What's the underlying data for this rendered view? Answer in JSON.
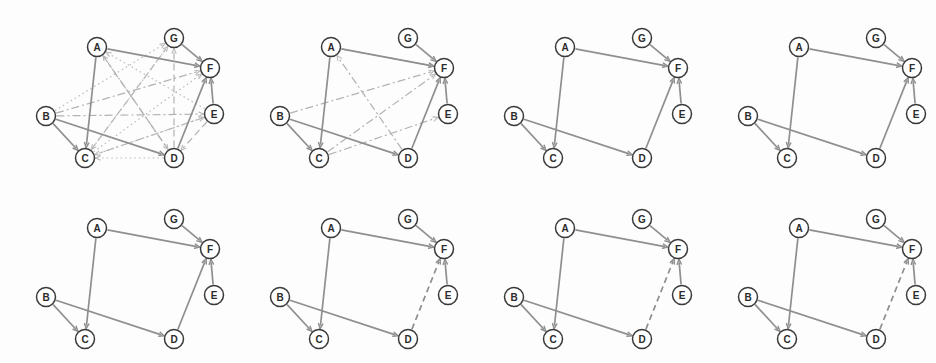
{
  "figure": {
    "title": "",
    "panel_count": 8,
    "rows": 2,
    "columns": 4,
    "background_color": "#fdfdfd",
    "node_fill": "#ffffff",
    "node_stroke": "#3a3a3a",
    "edge_color": "#9a9a9a",
    "spurious_edge_color": "#b9b9b9"
  },
  "nodes": [
    {
      "id": "A",
      "label": "A",
      "x": 97,
      "y": 47
    },
    {
      "id": "G",
      "label": "G",
      "x": 174,
      "y": 38
    },
    {
      "id": "F",
      "label": "F",
      "x": 210,
      "y": 68
    },
    {
      "id": "E",
      "label": "E",
      "x": 214,
      "y": 114
    },
    {
      "id": "B",
      "label": "B",
      "x": 46,
      "y": 116
    },
    {
      "id": "C",
      "label": "C",
      "x": 85,
      "y": 158
    },
    {
      "id": "D",
      "label": "D",
      "x": 174,
      "y": 158
    }
  ],
  "skeleton_edges": [
    {
      "from": "A",
      "to": "F",
      "style": "solid"
    },
    {
      "from": "A",
      "to": "C",
      "style": "solid"
    },
    {
      "from": "G",
      "to": "F",
      "style": "solid"
    },
    {
      "from": "E",
      "to": "F",
      "style": "solid"
    },
    {
      "from": "B",
      "to": "C",
      "style": "solid"
    },
    {
      "from": "B",
      "to": "D",
      "style": "solid"
    },
    {
      "from": "D",
      "to": "F",
      "style": "solid"
    }
  ],
  "panels": [
    {
      "index": 1,
      "name": "panel-1-complete-graph",
      "caption": "",
      "kept_edges": [
        {
          "from": "A",
          "to": "F",
          "style": "solid"
        },
        {
          "from": "A",
          "to": "C",
          "style": "solid"
        },
        {
          "from": "G",
          "to": "F",
          "style": "solid"
        },
        {
          "from": "E",
          "to": "F",
          "style": "solid"
        },
        {
          "from": "B",
          "to": "C",
          "style": "solid"
        },
        {
          "from": "B",
          "to": "D",
          "style": "solid"
        },
        {
          "from": "D",
          "to": "F",
          "style": "solid"
        }
      ],
      "spurious_edges": [
        {
          "from": "B",
          "to": "F",
          "style": "dashdot"
        },
        {
          "from": "B",
          "to": "G",
          "style": "dot"
        },
        {
          "from": "C",
          "to": "F",
          "style": "dot"
        },
        {
          "from": "C",
          "to": "G",
          "style": "dash"
        },
        {
          "from": "D",
          "to": "A",
          "style": "dash"
        },
        {
          "from": "D",
          "to": "C",
          "style": "dot"
        },
        {
          "from": "D",
          "to": "G",
          "style": "dash"
        },
        {
          "from": "E",
          "to": "C",
          "style": "dashdot"
        },
        {
          "from": "E",
          "to": "A",
          "style": "dot"
        },
        {
          "from": "E",
          "to": "D",
          "style": "dash"
        },
        {
          "from": "B",
          "to": "E",
          "style": "dashdot"
        },
        {
          "from": "C",
          "to": "E",
          "style": "dot"
        },
        {
          "from": "A",
          "to": "D",
          "style": "dashdot"
        },
        {
          "from": "G",
          "to": "C",
          "style": "dot"
        }
      ]
    },
    {
      "index": 2,
      "name": "panel-2-partially-pruned",
      "caption": "",
      "kept_edges": [
        {
          "from": "A",
          "to": "F",
          "style": "solid"
        },
        {
          "from": "A",
          "to": "C",
          "style": "solid"
        },
        {
          "from": "G",
          "to": "F",
          "style": "solid"
        },
        {
          "from": "E",
          "to": "F",
          "style": "solid"
        },
        {
          "from": "B",
          "to": "C",
          "style": "solid"
        },
        {
          "from": "B",
          "to": "D",
          "style": "solid"
        },
        {
          "from": "D",
          "to": "F",
          "style": "solid"
        }
      ],
      "spurious_edges": [
        {
          "from": "B",
          "to": "F",
          "style": "dashdot"
        },
        {
          "from": "C",
          "to": "F",
          "style": "dashdot"
        },
        {
          "from": "A",
          "to": "F",
          "style": "dashdot"
        },
        {
          "from": "C",
          "to": "E",
          "style": "dashdot"
        },
        {
          "from": "D",
          "to": "A",
          "style": "dashdot"
        }
      ]
    },
    {
      "index": 3,
      "name": "panel-3-skeleton",
      "caption": "",
      "kept_edges": [
        {
          "from": "A",
          "to": "F",
          "style": "solid"
        },
        {
          "from": "A",
          "to": "C",
          "style": "solid"
        },
        {
          "from": "G",
          "to": "F",
          "style": "solid"
        },
        {
          "from": "E",
          "to": "F",
          "style": "solid"
        },
        {
          "from": "B",
          "to": "C",
          "style": "solid"
        },
        {
          "from": "B",
          "to": "D",
          "style": "solid"
        },
        {
          "from": "D",
          "to": "F",
          "style": "solid"
        }
      ],
      "spurious_edges": []
    },
    {
      "index": 4,
      "name": "panel-4-skeleton",
      "caption": "",
      "kept_edges": [
        {
          "from": "A",
          "to": "F",
          "style": "solid"
        },
        {
          "from": "A",
          "to": "C",
          "style": "solid"
        },
        {
          "from": "G",
          "to": "F",
          "style": "solid"
        },
        {
          "from": "E",
          "to": "F",
          "style": "solid"
        },
        {
          "from": "B",
          "to": "C",
          "style": "solid"
        },
        {
          "from": "B",
          "to": "D",
          "style": "solid"
        },
        {
          "from": "D",
          "to": "F",
          "style": "solid"
        }
      ],
      "spurious_edges": []
    },
    {
      "index": 5,
      "name": "panel-5-skeleton",
      "caption": "",
      "kept_edges": [
        {
          "from": "A",
          "to": "F",
          "style": "solid"
        },
        {
          "from": "A",
          "to": "C",
          "style": "solid"
        },
        {
          "from": "G",
          "to": "F",
          "style": "solid"
        },
        {
          "from": "E",
          "to": "F",
          "style": "solid"
        },
        {
          "from": "B",
          "to": "C",
          "style": "solid"
        },
        {
          "from": "B",
          "to": "D",
          "style": "solid"
        },
        {
          "from": "D",
          "to": "F",
          "style": "solid"
        }
      ],
      "spurious_edges": []
    },
    {
      "index": 6,
      "name": "panel-6-df-dashed",
      "caption": "",
      "kept_edges": [
        {
          "from": "A",
          "to": "F",
          "style": "solid"
        },
        {
          "from": "A",
          "to": "C",
          "style": "solid"
        },
        {
          "from": "G",
          "to": "F",
          "style": "solid"
        },
        {
          "from": "E",
          "to": "F",
          "style": "solid"
        },
        {
          "from": "B",
          "to": "C",
          "style": "solid"
        },
        {
          "from": "B",
          "to": "D",
          "style": "solid"
        },
        {
          "from": "D",
          "to": "F",
          "style": "dashed"
        }
      ],
      "spurious_edges": []
    },
    {
      "index": 7,
      "name": "panel-7-df-dashed",
      "caption": "",
      "kept_edges": [
        {
          "from": "A",
          "to": "F",
          "style": "solid"
        },
        {
          "from": "A",
          "to": "C",
          "style": "solid"
        },
        {
          "from": "G",
          "to": "F",
          "style": "solid"
        },
        {
          "from": "E",
          "to": "F",
          "style": "solid"
        },
        {
          "from": "B",
          "to": "C",
          "style": "solid"
        },
        {
          "from": "B",
          "to": "D",
          "style": "solid"
        },
        {
          "from": "D",
          "to": "F",
          "style": "dashed"
        }
      ],
      "spurious_edges": []
    },
    {
      "index": 8,
      "name": "panel-8-df-dashed",
      "caption": "",
      "kept_edges": [
        {
          "from": "A",
          "to": "F",
          "style": "solid"
        },
        {
          "from": "A",
          "to": "C",
          "style": "solid"
        },
        {
          "from": "G",
          "to": "F",
          "style": "solid"
        },
        {
          "from": "E",
          "to": "F",
          "style": "solid"
        },
        {
          "from": "B",
          "to": "C",
          "style": "solid"
        },
        {
          "from": "B",
          "to": "D",
          "style": "solid"
        },
        {
          "from": "D",
          "to": "F",
          "style": "dashed"
        }
      ],
      "spurious_edges": []
    }
  ]
}
